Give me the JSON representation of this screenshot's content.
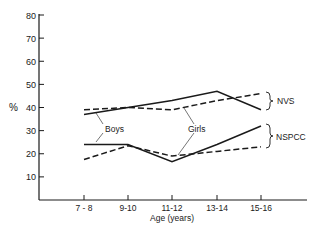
{
  "chart_data": {
    "type": "line",
    "title": "",
    "xlabel": "Age (years)",
    "ylabel": "%",
    "ylim": [
      0,
      80
    ],
    "yticks": [
      10,
      20,
      30,
      40,
      50,
      60,
      70,
      80
    ],
    "grid": false,
    "categories": [
      "7-8",
      "9-10",
      "11-12",
      "13-14",
      "15-16"
    ],
    "series": [
      {
        "name": "NVS Boys",
        "group": "NVS",
        "sex": "Boys",
        "style": "solid",
        "values": [
          37,
          40,
          43,
          47,
          39
        ]
      },
      {
        "name": "NVS Girls",
        "group": "NVS",
        "sex": "Girls",
        "style": "dashed",
        "values": [
          39,
          40,
          39,
          43,
          46
        ]
      },
      {
        "name": "NSPCC Boys",
        "group": "NSPCC",
        "sex": "Boys",
        "style": "solid",
        "values": [
          24,
          24,
          16.5,
          24,
          32
        ]
      },
      {
        "name": "NSPCC Girls",
        "group": "NSPCC",
        "sex": "Girls",
        "style": "dashed",
        "values": [
          17.5,
          23.5,
          19,
          21,
          23
        ]
      }
    ],
    "annotations": [
      {
        "text": "Boys",
        "points_to": "solid lines"
      },
      {
        "text": "Girls",
        "points_to": "dashed lines"
      },
      {
        "text": "NVS",
        "brace": "upper pair of lines"
      },
      {
        "text": "NSPCC",
        "brace": "lower pair of lines"
      }
    ],
    "legend_position": "right (braces)"
  },
  "labels": {
    "y_unit": "%",
    "x_title": "Age (years)",
    "boys": "Boys",
    "girls": "Girls",
    "nvs": "NVS",
    "nspcc": "NSPCC"
  }
}
